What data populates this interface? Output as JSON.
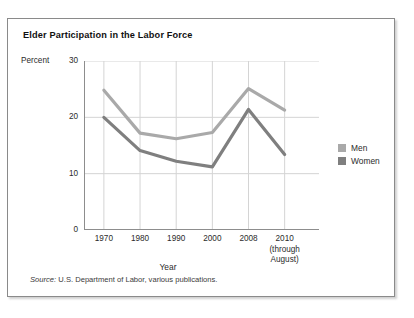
{
  "figure": {
    "title": "Elder Participation in the Labor Force",
    "source_label": "Source:",
    "source_text": "U.S. Department of Labor, various publications."
  },
  "legend": {
    "position": "right",
    "items": [
      {
        "label": "Men",
        "color": "#a9a9a9",
        "icon": "legend-swatch-icon"
      },
      {
        "label": "Women",
        "color": "#7f7f7f",
        "icon": "legend-swatch-icon"
      }
    ]
  },
  "chart_data": {
    "type": "line",
    "title": "Elder Participation in the Labor Force",
    "xlabel": "Year",
    "ylabel": "Percent",
    "categories": [
      "1970",
      "1980",
      "1990",
      "2000",
      "2008",
      "2010"
    ],
    "category_sublabels": [
      "",
      "",
      "",
      "",
      "",
      "(through August)"
    ],
    "ylim": [
      0,
      30
    ],
    "yticks": [
      0,
      10,
      20,
      30
    ],
    "ytick_labels": [
      "0",
      "10",
      "20",
      "30"
    ],
    "grid": "horizontal-and-vertical",
    "series": [
      {
        "name": "Men",
        "color": "#a9a9a9",
        "values": [
          24.8,
          17.2,
          16.2,
          17.3,
          25.1,
          21.3
        ]
      },
      {
        "name": "Women",
        "color": "#7f7f7f",
        "values": [
          20.0,
          14.1,
          12.2,
          11.2,
          21.4,
          13.4
        ]
      }
    ]
  }
}
